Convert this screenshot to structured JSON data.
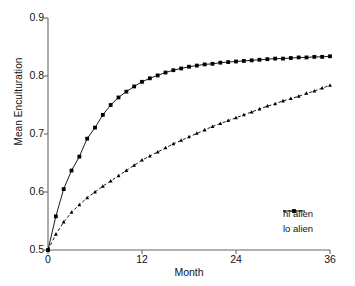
{
  "chart_data": {
    "type": "line",
    "title": "",
    "xlabel": "Month",
    "ylabel": "Mean Enculturation",
    "xlim": [
      0,
      36
    ],
    "ylim": [
      0.5,
      0.9
    ],
    "xticks": [
      0,
      12,
      24,
      36
    ],
    "xtick_labels": [
      "0",
      "12",
      "24",
      "36"
    ],
    "yticks": [
      0.5,
      0.6,
      0.7,
      0.8,
      0.9
    ],
    "ytick_labels": [
      "0.5",
      "0.6",
      "0.7",
      "0.8",
      "0.9"
    ],
    "grid": false,
    "legend_position": "lower right",
    "x": [
      0,
      1,
      2,
      3,
      4,
      5,
      6,
      7,
      8,
      9,
      10,
      11,
      12,
      13,
      14,
      15,
      16,
      17,
      18,
      19,
      20,
      21,
      22,
      23,
      24,
      25,
      26,
      27,
      28,
      29,
      30,
      31,
      32,
      33,
      34,
      35,
      36
    ],
    "series": [
      {
        "name": "hi alien",
        "line_style": "solid",
        "marker": "square",
        "color": "#000000",
        "values": [
          0.5,
          0.558,
          0.605,
          0.637,
          0.661,
          0.692,
          0.711,
          0.733,
          0.75,
          0.763,
          0.773,
          0.782,
          0.79,
          0.796,
          0.801,
          0.806,
          0.81,
          0.813,
          0.816,
          0.818,
          0.82,
          0.821,
          0.823,
          0.824,
          0.825,
          0.826,
          0.827,
          0.828,
          0.829,
          0.83,
          0.83,
          0.831,
          0.832,
          0.832,
          0.833,
          0.833,
          0.834
        ]
      },
      {
        "name": "lo alien",
        "line_style": "dashdot",
        "marker": "triangle",
        "color": "#000000",
        "values": [
          0.5,
          0.527,
          0.548,
          0.565,
          0.578,
          0.59,
          0.6,
          0.61,
          0.619,
          0.628,
          0.637,
          0.646,
          0.655,
          0.662,
          0.669,
          0.676,
          0.683,
          0.689,
          0.695,
          0.701,
          0.707,
          0.713,
          0.718,
          0.723,
          0.728,
          0.733,
          0.738,
          0.743,
          0.748,
          0.752,
          0.757,
          0.761,
          0.765,
          0.77,
          0.774,
          0.779,
          0.784
        ]
      }
    ]
  },
  "legend": {
    "entries": [
      {
        "label": "hi alien"
      },
      {
        "label": "lo alien"
      }
    ]
  },
  "colors": {
    "axis": "#666666",
    "line": "#000000",
    "background": "#ffffff"
  }
}
